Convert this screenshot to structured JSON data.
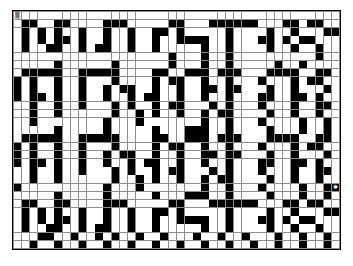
{
  "document": {
    "title": "Crossword Grid Pattern",
    "kind": "puzzle-grid",
    "background_color": "#ffffff"
  },
  "grid": {
    "columns": 40,
    "rows": 29,
    "cell_colors": {
      "empty": "#ffffff",
      "filled": "#000000",
      "gridline": "#8d8d8d",
      "border": "#000000"
    },
    "legend": {
      "filled_label": "filled square",
      "empty_label": "empty square"
    },
    "markers": [
      {
        "row": 0,
        "col": 0,
        "glyph": "▒",
        "name": "start-marker"
      },
      {
        "row": 21,
        "col": 39,
        "glyph": "✱",
        "name": "end-marker"
      }
    ],
    "cells": [
      "0000000000000000000000000000000000000000",
      "0110011000011100000110001111110001101100",
      "0101010010010010011010000010000100100011",
      "0101011010010010010011110010001101011000",
      "0100110010110010010000010010000100100100",
      "0000000000000000000100010010000000000100",
      "0000010000001000000100010010000010010000",
      "0111110011111000011001110111000111100110",
      "1010010010001000010110010010001000101100",
      "1010010010010110010010011011000100100010",
      "1011010010010010110010010010001100110100",
      "0010010010001010010110001010001000100110",
      "0010010000001001010010010110000100100100",
      "0010000000010001000000010010001000010010",
      "0000010000010000010001110010000100010010",
      "0111110011111000011001110111000111100110",
      "1010010010001000010110010010001000101100",
      "1010010010010110010010011011000100100010",
      "1011010010010010110010010010001100110100",
      "0010010010001010010110001010001000100110",
      "0010010000001001010010010110000100100100",
      "1000000000010001000000010010001000010011",
      "0000010000010000010001110010000100010010",
      "0110011000011100000110001111110001101100",
      "0101010010010010011010000010000100100011",
      "0101011010010010010011110010001101011000",
      "0100110010110010010000010010000100100100",
      "0001100100101001001000100100100010010010",
      "0010010010010010010010010010010010010010"
    ]
  }
}
